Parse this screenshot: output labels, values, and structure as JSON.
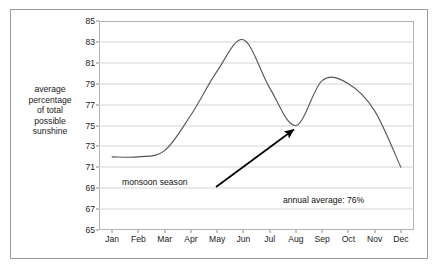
{
  "chart_data": {
    "type": "line",
    "title": "",
    "xlabel": "",
    "ylabel": "average percentage of total possible sunshine",
    "categories": [
      "Jan",
      "Feb",
      "Mar",
      "Apr",
      "May",
      "Jun",
      "Jul",
      "Aug",
      "Sep",
      "Oct",
      "Nov",
      "Dec"
    ],
    "values": [
      72.0,
      72.0,
      72.6,
      76.0,
      80.2,
      83.2,
      78.6,
      75.0,
      79.3,
      79.0,
      76.4,
      71.0
    ],
    "series": [
      {
        "name": "average percentage of total possible sunshine",
        "values": [
          72.0,
          72.0,
          72.6,
          76.0,
          80.2,
          83.2,
          78.6,
          75.0,
          79.3,
          79.0,
          76.4,
          71.0
        ]
      }
    ],
    "ylim": [
      65,
      85
    ],
    "ytick_values": [
      65,
      67,
      69,
      71,
      73,
      75,
      77,
      79,
      81,
      83,
      85
    ],
    "ytick_labels": [
      "65",
      "67",
      "69",
      "71",
      "73",
      "75",
      "77",
      "79",
      "81",
      "83",
      "85"
    ],
    "grid": true,
    "legend": "none",
    "line_color": "#555555",
    "annotations": [
      {
        "text": "monsoon season",
        "points_to_month": "Aug",
        "points_to_value": 75.0
      },
      {
        "text": "annual average: 76%"
      }
    ]
  },
  "axis": {
    "y_title": "average\npercentage\nof total\npossible\nsunshine"
  },
  "annotations": {
    "monsoon": "monsoon season",
    "annual_average": "annual average: 76%"
  },
  "colors": {
    "frame": "#9a9a9a",
    "plot_border": "#b4b4b4",
    "grid": "#d3d3d3",
    "line": "#555555",
    "arrow": "#000000",
    "text": "#1a1a1a",
    "background": "#ffffff"
  }
}
